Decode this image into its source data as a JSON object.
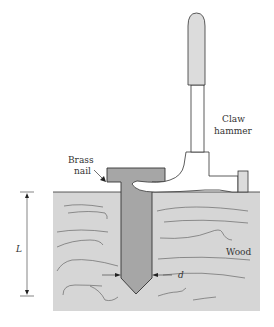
{
  "diagram": {
    "labels": {
      "brass_nail_line1": "Brass",
      "brass_nail_line2": "nail",
      "claw_hammer_line1": "Claw",
      "claw_hammer_line2": "hammer",
      "wood": "Wood",
      "length": "L",
      "diameter": "d"
    },
    "colors": {
      "wood_fill": "#d6d6d6",
      "nail_fill": "#a6a6a6",
      "hammer_grip_fill": "#dcdcdc",
      "outline": "#333333",
      "grain": "#555555"
    }
  }
}
